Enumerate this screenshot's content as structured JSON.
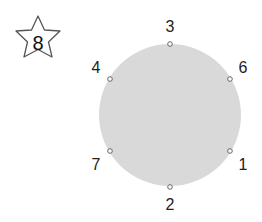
{
  "star": {
    "number": "8"
  },
  "circle": {
    "fill": "#d9d9d9"
  },
  "points": [
    {
      "label": "3",
      "position": "top"
    },
    {
      "label": "6",
      "position": "upper-right"
    },
    {
      "label": "1",
      "position": "lower-right"
    },
    {
      "label": "2",
      "position": "bottom"
    },
    {
      "label": "7",
      "position": "lower-left"
    },
    {
      "label": "4",
      "position": "upper-left"
    }
  ]
}
